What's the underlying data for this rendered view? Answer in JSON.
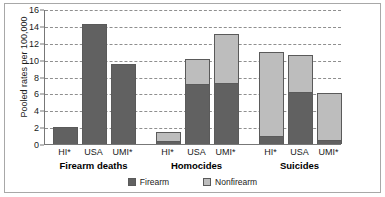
{
  "chart_data": {
    "type": "bar",
    "subtype": "grouped-stacked-bar",
    "title": "",
    "xlabel": "",
    "ylabel": "Pooled rates per 100,000",
    "ylim": [
      0,
      16
    ],
    "yticks": [
      0,
      2,
      4,
      6,
      8,
      10,
      12,
      14,
      16
    ],
    "ytick_labels": [
      "0",
      "2",
      "4",
      "6",
      "8",
      "10",
      "12",
      "14",
      "16"
    ],
    "grid": true,
    "grid_axis": "y",
    "grid_style": "dashed",
    "legend_position": "bottom-center",
    "stack_order": [
      "Firearm",
      "Nonfirearm"
    ],
    "series": [
      {
        "name": "Firearm",
        "color": "#616161"
      },
      {
        "name": "Nonfirearm",
        "color": "#bdbdbd"
      }
    ],
    "groups": [
      {
        "label": "Firearm deaths",
        "categories": [
          "HI*",
          "USA",
          "UMI*"
        ],
        "bars": [
          {
            "category": "HI*",
            "firearm": 2.0,
            "nonfirearm": 0.0,
            "total": 2.0
          },
          {
            "category": "USA",
            "firearm": 14.2,
            "nonfirearm": 0.0,
            "total": 14.2
          },
          {
            "category": "UMI*",
            "firearm": 9.5,
            "nonfirearm": 0.0,
            "total": 9.5
          }
        ]
      },
      {
        "label": "Homocides",
        "categories": [
          "HI*",
          "USA",
          "UMI*"
        ],
        "bars": [
          {
            "category": "HI*",
            "firearm": 0.4,
            "nonfirearm": 1.0,
            "total": 1.4
          },
          {
            "category": "USA",
            "firearm": 7.1,
            "nonfirearm": 3.0,
            "total": 10.1
          },
          {
            "category": "UMI*",
            "firearm": 7.2,
            "nonfirearm": 5.8,
            "total": 13.0
          }
        ]
      },
      {
        "label": "Suicides",
        "categories": [
          "HI*",
          "USA",
          "UMI*"
        ],
        "bars": [
          {
            "category": "HI*",
            "firearm": 1.0,
            "nonfirearm": 9.9,
            "total": 10.9
          },
          {
            "category": "USA",
            "firearm": 6.2,
            "nonfirearm": 4.3,
            "total": 10.5
          },
          {
            "category": "UMI*",
            "firearm": 0.5,
            "nonfirearm": 5.5,
            "total": 6.0
          }
        ]
      }
    ]
  },
  "legend": {
    "items": [
      {
        "label": "Firearm",
        "color": "#616161"
      },
      {
        "label": "Nonfirearm",
        "color": "#bdbdbd"
      }
    ]
  },
  "colors": {
    "firearm": "#616161",
    "nonfirearm": "#bdbdbd",
    "axis": "#777777",
    "grid": "#8f8f8f",
    "frame": "#a8a8a8",
    "background": "#ffffff",
    "text": "#1a1a1a"
  }
}
